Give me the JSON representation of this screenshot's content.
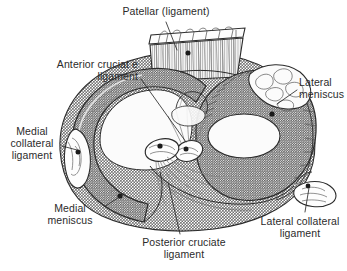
{
  "figure": {
    "background_color": "#ffffff",
    "ink_color": "#2b2b2b",
    "fill_gray": "#9a9a9a",
    "fill_light": "#f2f2f2",
    "width": 347,
    "height": 271
  },
  "labels": [
    {
      "id": "patellar",
      "text": "Patellar (ligament)",
      "align": "center",
      "leader": {
        "from_x": 166,
        "from_y": 22,
        "to_x": 176,
        "to_y": 48
      }
    },
    {
      "id": "anterior-cruciate-ligament",
      "text": "Anterior cruciat e\nligament",
      "align": "right",
      "leader": {
        "from_x": 141,
        "from_y": 79,
        "to_x": 186,
        "to_y": 140
      }
    },
    {
      "id": "lateral-meniscus",
      "text": "Lateral\nmeniscus",
      "align": "left",
      "leader": {
        "from_x": 297,
        "from_y": 90,
        "to_x": 276,
        "to_y": 104
      }
    },
    {
      "id": "medial-collateral-ligament",
      "text": "Medial\ncollateral\nligament",
      "align": "center",
      "leader": {
        "from_x": 62,
        "from_y": 146,
        "to_x": 78,
        "to_y": 150
      }
    },
    {
      "id": "medial-meniscus",
      "text": "Medial\nmeniscus",
      "align": "center",
      "leader": {
        "from_x": 104,
        "from_y": 207,
        "to_x": 122,
        "to_y": 196
      }
    },
    {
      "id": "posterior-cruciate-ligament",
      "text": "Posterior cruciate\nligament",
      "align": "center",
      "leader": {
        "from_x": 180,
        "from_y": 234,
        "to_x": 170,
        "to_y": 186
      }
    },
    {
      "id": "lateral-collateral-ligament",
      "text": "Lateral collateral\nligament",
      "align": "center",
      "leader": {
        "from_x": 305,
        "from_y": 213,
        "to_x": 308,
        "to_y": 186
      }
    }
  ],
  "structures": [
    {
      "id": "patellar-ligament-stump",
      "name": "Patellar ligament (cut stump)",
      "texture": "striated"
    },
    {
      "id": "medial-meniscus-body",
      "name": "Medial meniscus",
      "shape": "crescent",
      "texture": "stippled"
    },
    {
      "id": "lateral-meniscus-body",
      "name": "Lateral meniscus",
      "shape": "ring",
      "texture": "stippled"
    },
    {
      "id": "tibial-plateau",
      "name": "Tibial plateau",
      "texture": "stippled"
    },
    {
      "id": "anterior-cruciate-stump",
      "name": "Anterior cruciate ligament (cut)",
      "shape": "oval"
    },
    {
      "id": "posterior-cruciate-stump",
      "name": "Posterior cruciate ligament (cut)",
      "shape": "oval"
    },
    {
      "id": "medial-collateral-stump",
      "name": "Medial collateral ligament (cut)",
      "shape": "lens"
    },
    {
      "id": "lateral-collateral-stump",
      "name": "Lateral collateral ligament (cut)",
      "shape": "oval"
    }
  ]
}
